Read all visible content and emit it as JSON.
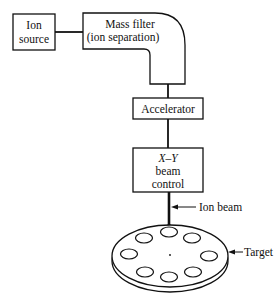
{
  "diagram": {
    "type": "ion implantation system block diagram",
    "nodes": {
      "ion_source": {
        "line1": "Ion",
        "line2": "source"
      },
      "mass_filter": {
        "line1": "Mass filter",
        "line2": "(ion separation)"
      },
      "accelerator": {
        "label": "Accelerator"
      },
      "beam_control": {
        "line1": "X–Y",
        "line2": "beam",
        "line3": "control"
      },
      "target": {
        "label": "—Target",
        "wafer_count": 8
      }
    },
    "annotations": {
      "ion_beam": "Ion beam",
      "target": "Target"
    },
    "connections": [
      "ion_source -> mass_filter",
      "mass_filter -> accelerator",
      "accelerator -> beam_control",
      "beam_control -> target (ion beam)"
    ],
    "colors": {
      "ink": "#111111",
      "background": "#ffffff"
    }
  }
}
